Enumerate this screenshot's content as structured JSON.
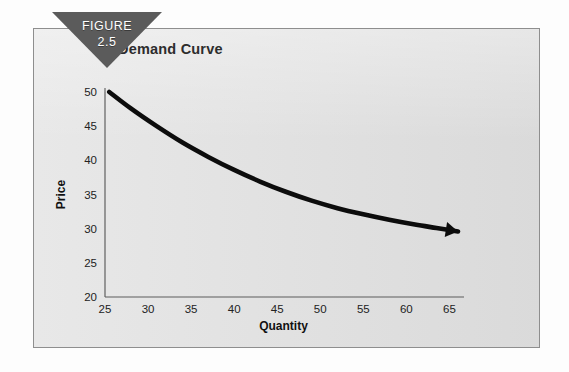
{
  "figure": {
    "banner_label": "FIGURE",
    "banner_number": "2.5",
    "banner_color": "#5b5b5b",
    "panel_color": "#e3e3e3",
    "border_color": "#8e8e8e"
  },
  "chart_data": {
    "type": "line",
    "title": "Demand Curve",
    "xlabel": "Quantity",
    "ylabel": "Price",
    "xlim": [
      25,
      66
    ],
    "ylim": [
      20,
      50
    ],
    "xticks": [
      25,
      30,
      35,
      40,
      45,
      50,
      55,
      60,
      65
    ],
    "yticks": [
      20,
      25,
      30,
      35,
      40,
      45,
      50
    ],
    "grid": false,
    "legend": "none",
    "series": [
      {
        "name": "Demand",
        "color": "#0c0c0c",
        "arrow_end": true,
        "x": [
          25.5,
          28,
          31,
          34,
          37,
          40,
          43,
          46,
          49,
          52,
          55,
          58,
          61,
          63.5,
          66
        ],
        "y": [
          50.0,
          47.6,
          45.0,
          42.6,
          40.5,
          38.6,
          36.9,
          35.4,
          34.1,
          33.0,
          32.1,
          31.3,
          30.6,
          30.1,
          29.6
        ]
      }
    ],
    "annotations": []
  }
}
